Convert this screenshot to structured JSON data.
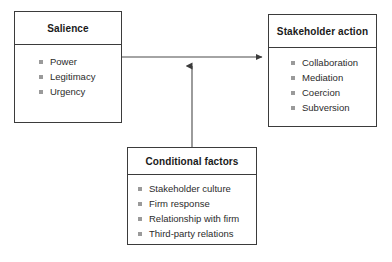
{
  "diagram": {
    "type": "flow-diagram",
    "nodes": [
      {
        "id": "salience",
        "title": "Salience",
        "items": [
          "Power",
          "Legitimacy",
          "Urgency"
        ]
      },
      {
        "id": "stakeholder_action",
        "title": "Stakeholder action",
        "items": [
          "Collaboration",
          "Mediation",
          "Coercion",
          "Subversion"
        ]
      },
      {
        "id": "conditional_factors",
        "title": "Conditional factors",
        "items": [
          "Stakeholder culture",
          "Firm response",
          "Relationship with firm",
          "Third-party relations"
        ]
      }
    ],
    "connectors": [
      {
        "id": "salience-to-action",
        "from": "salience",
        "to": "stakeholder_action",
        "style": "solid-arrow",
        "direction": "right"
      },
      {
        "id": "conditional-to-link",
        "from": "conditional_factors",
        "to": "salience-to-action",
        "style": "solid-arrow",
        "direction": "up"
      }
    ],
    "colors": {
      "border": "#3b3b3b",
      "text": "#2b2b2b",
      "title_text": "#1a1a1a",
      "bullet": "#9a9a9a",
      "connector": "#4a4a4a",
      "background": "#ffffff"
    }
  }
}
